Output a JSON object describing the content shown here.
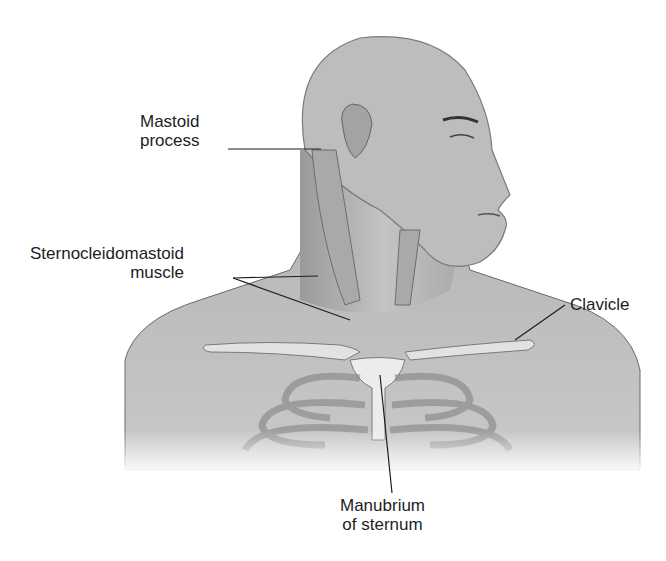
{
  "figure": {
    "colors": {
      "background": "#ffffff",
      "skin": "#b9b9b9",
      "skin_dark": "#8d8d8d",
      "muscle": "#a8a8a8",
      "bone": "#dcdcdc",
      "leader_line": "#1e1e1e",
      "text": "#1e1e1e"
    }
  },
  "labels": {
    "mastoid": {
      "line1": "Mastoid",
      "line2": "process"
    },
    "scm": {
      "line1": "Sternocleidomastoid",
      "line2": "muscle"
    },
    "clavicle": {
      "line1": "Clavicle"
    },
    "manubrium": {
      "line1": "Manubrium",
      "line2": "of sternum"
    }
  }
}
